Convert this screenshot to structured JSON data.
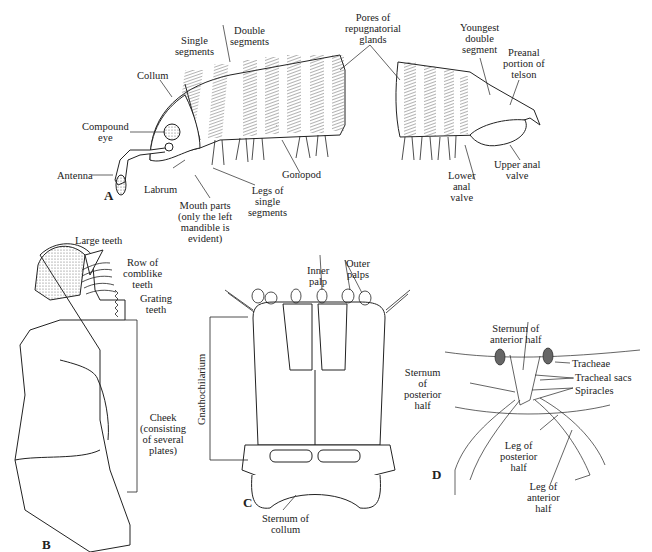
{
  "figure": {
    "panels": {
      "A": {
        "letter": "A",
        "labels": {
          "single_segments": "Single\nsegments",
          "double_segments": "Double\nsegments",
          "pores": "Pores of\nrepugnatorial\nglands",
          "youngest": "Youngest\ndouble\nsegment",
          "preanal": "Preanal\nportion of\ntelson",
          "collum": "Collum",
          "compound_eye": "Compound\neye",
          "antenna": "Antenna",
          "labrum": "Labrum",
          "mouth_parts": "Mouth parts\n(only the left\nmandible is\nevident)",
          "legs_single": "Legs of\nsingle\nsegments",
          "gonopod": "Gonopod",
          "lower_anal": "Lower\nanal\nvalve",
          "upper_anal": "Upper anal\nvalve"
        }
      },
      "B": {
        "letter": "B",
        "labels": {
          "large_teeth": "Large teeth",
          "comblike": "Row of\ncomblike\nteeth",
          "grating": "Grating\nteeth",
          "cheek": "Cheek\n(consisting\nof several\nplates)"
        }
      },
      "C": {
        "letter": "C",
        "labels": {
          "inner_palp": "Inner\npalp",
          "outer_palps": "Outer\npalps",
          "gnathochilarium": "Gnathochilarium",
          "sternum_collum": "Sternum of\ncollum"
        }
      },
      "D": {
        "letter": "D",
        "labels": {
          "sternum_anterior": "Sternum of\nanterior half",
          "tracheae": "Tracheae",
          "tracheal_sacs": "Tracheal sacs",
          "spiracles": "Spiracles",
          "sternum_posterior": "Sternum\nof\nposterior\nhalf",
          "leg_posterior": "Leg of\nposterior\nhalf",
          "leg_anterior": "Leg of\nanterior\nhalf"
        }
      }
    }
  }
}
